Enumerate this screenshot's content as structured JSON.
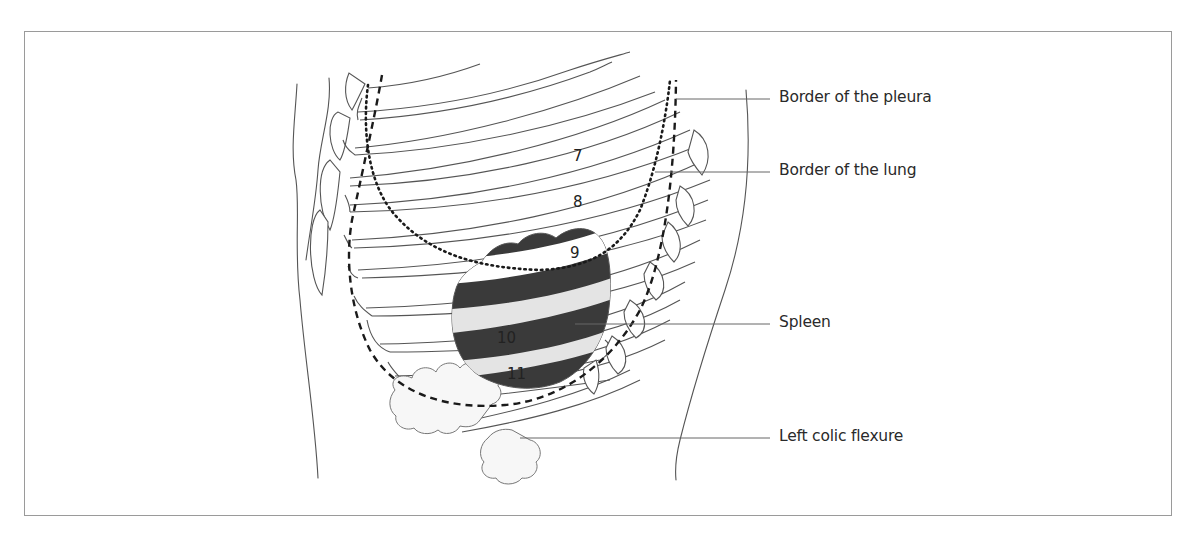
{
  "figure": {
    "type": "anatomical-illustration",
    "colors": {
      "frame": "#9a9a9a",
      "line": "#555555",
      "spleen_dark": "#3a3a3a",
      "spleen_light": "#e4e4e4",
      "text": "#2a2a2a"
    }
  },
  "labels": {
    "pleura": "Border of the pleura",
    "lung": "Border of the lung",
    "spleen": "Spleen",
    "colic_flexure": "Left colic flexure"
  },
  "rib_numbers": {
    "r7": "7",
    "r8": "8",
    "r9": "9",
    "r10": "10",
    "r11": "11"
  }
}
